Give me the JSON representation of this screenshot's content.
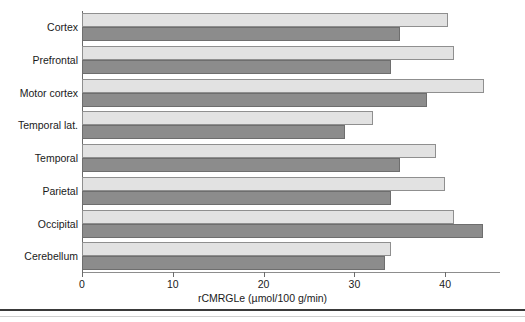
{
  "chart_data": {
    "type": "bar",
    "orientation": "horizontal",
    "title": "",
    "subtitle": "",
    "xlabel": "rCMRGLe (µmol/100 g/min)",
    "ylabel": "",
    "xlim": [
      0,
      46
    ],
    "xticks": [
      0,
      10,
      20,
      30,
      40
    ],
    "xtick_labels": [
      "0",
      "10",
      "20",
      "30",
      "40"
    ],
    "grid": false,
    "legend": "none",
    "categories": [
      "Cortex",
      "Prefrontal",
      "Motor cortex",
      "Temporal lat.",
      "Temporal",
      "Parietal",
      "Occipital",
      "Cerebellum"
    ],
    "series": [
      {
        "name": "light",
        "color": "#e2e2e2",
        "values": [
          40.3,
          41.0,
          44.3,
          32.0,
          39.0,
          40.0,
          41.0,
          34.0
        ]
      },
      {
        "name": "dark",
        "color": "#8c8c8c",
        "values": [
          35.0,
          34.0,
          38.0,
          29.0,
          35.0,
          34.0,
          44.2,
          33.4
        ]
      }
    ]
  },
  "axis": {
    "unit_label": "rCMRGLe (µmol/100 g/min)"
  }
}
